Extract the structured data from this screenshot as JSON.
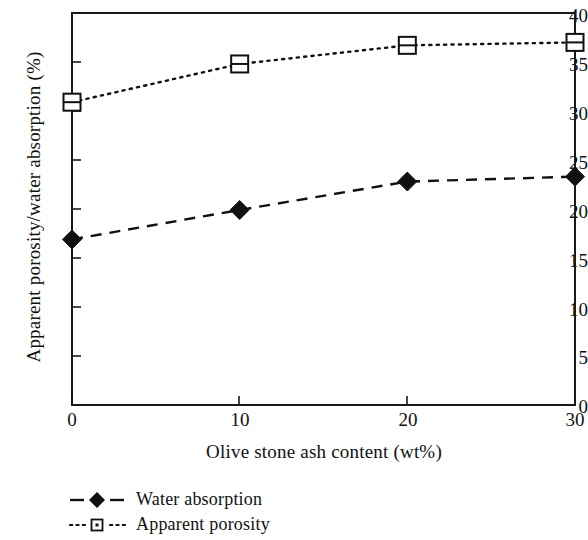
{
  "chart_data": {
    "type": "line",
    "title": "",
    "xlabel": "Olive stone ash content (wt%)",
    "ylabel": "Apparent porosity/water absorption (%)",
    "x": [
      0,
      10,
      20,
      30
    ],
    "xlim": [
      0,
      30
    ],
    "ylim": [
      0,
      40
    ],
    "xticks": [
      "0",
      "10",
      "20",
      "30"
    ],
    "yticks": [
      "0",
      "5",
      "10",
      "15",
      "20",
      "25",
      "30",
      "35",
      "40"
    ],
    "grid": false,
    "legend_position": "below-axes-left",
    "series": [
      {
        "name": "Water absorption",
        "values": [
          16.9,
          19.9,
          22.8,
          23.3
        ],
        "marker": "filled-diamond",
        "linestyle": "dashed",
        "color": "#111111"
      },
      {
        "name": "Apparent porosity",
        "values": [
          30.9,
          34.8,
          36.7,
          37.0
        ],
        "marker": "open-square",
        "linestyle": "dotted",
        "color": "#111111"
      }
    ]
  },
  "axes": {
    "ytick_labels": [
      "40",
      "35",
      "30",
      "25",
      "20",
      "15",
      "10",
      "5",
      "0"
    ],
    "xtick_labels": [
      "0",
      "10",
      "20",
      "30"
    ]
  },
  "legend": {
    "items": [
      {
        "label": "Water absorption",
        "marker": "filled-diamond",
        "linestyle": "dashed"
      },
      {
        "label": "Apparent porosity",
        "marker": "open-square",
        "linestyle": "dotted"
      }
    ]
  },
  "colors": {
    "axis": "#1a1a1a",
    "ink": "#111111",
    "background": "#ffffff"
  }
}
